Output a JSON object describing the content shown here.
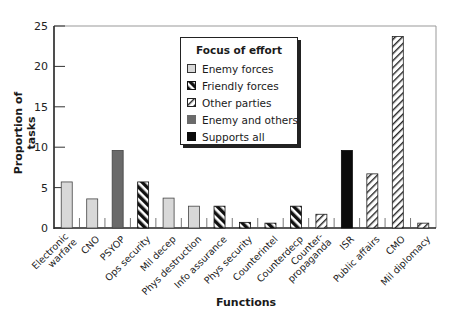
{
  "chart_data": {
    "type": "bar",
    "title": "",
    "xlabel": "Functions",
    "ylabel": "Proportion of tasks",
    "ylim": [
      0,
      25
    ],
    "yticks": [
      0,
      5,
      10,
      15,
      20,
      25
    ],
    "grid": false,
    "legend_position": "upper center (inside plot)",
    "legend_title": "Focus of effort",
    "legend": [
      {
        "name": "Enemy forces",
        "pattern": "light-gray"
      },
      {
        "name": "Friendly forces",
        "pattern": "black-white-back-hatch"
      },
      {
        "name": "Other parties",
        "pattern": "white-forward-hatch"
      },
      {
        "name": "Enemy and others",
        "pattern": "dark-gray"
      },
      {
        "name": "Supports all",
        "pattern": "black"
      }
    ],
    "categories": [
      "Electronic warfare",
      "CNO",
      "PSYOP",
      "Ops security",
      "Mil decep",
      "Phys destruction",
      "Info assurance",
      "Phys security",
      "Counterintel",
      "Counterdecp",
      "Counter-propaganda",
      "ISR",
      "Public affairs",
      "CMO",
      "Mil diplomacy"
    ],
    "values": [
      5.7,
      3.6,
      9.6,
      5.7,
      3.7,
      2.7,
      2.7,
      0.7,
      0.6,
      2.7,
      1.7,
      9.6,
      6.7,
      23.7,
      0.6
    ],
    "focus": [
      "Enemy forces",
      "Enemy forces",
      "Enemy and others",
      "Friendly forces",
      "Enemy forces",
      "Enemy forces",
      "Friendly forces",
      "Friendly forces",
      "Friendly forces",
      "Friendly forces",
      "Other parties",
      "Supports all",
      "Other parties",
      "Other parties",
      "Other parties"
    ]
  },
  "labels": {
    "ylabel": "Proportion of tasks",
    "xlabel": "Functions",
    "legend_title": "Focus of effort",
    "legend_items": [
      "Enemy forces",
      "Friendly forces",
      "Other parties",
      "Enemy and others",
      "Supports all"
    ]
  }
}
